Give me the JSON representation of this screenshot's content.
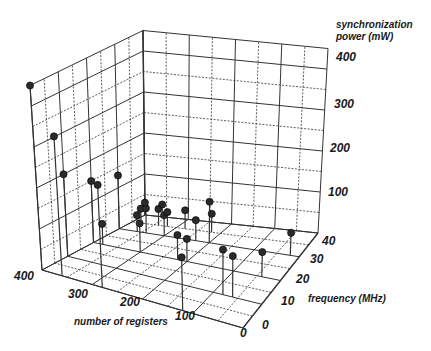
{
  "chart_data": {
    "type": "scatter",
    "subtype": "3d-stem",
    "title": "",
    "axes": {
      "x": {
        "label": "number of registers",
        "ticks": [
          400,
          300,
          200,
          100,
          0
        ],
        "range": [
          0,
          400
        ]
      },
      "y": {
        "label": "frequency (MHz)",
        "ticks": [
          0,
          10,
          20,
          30,
          40
        ],
        "range": [
          0,
          40
        ]
      },
      "z": {
        "label_line1": "synchronization",
        "label_line2": "power (mW)",
        "ticks": [
          100,
          200,
          300,
          400
        ],
        "range": [
          0,
          450
        ]
      }
    },
    "grid": true,
    "legend": "none",
    "marker_color": "#2a2a2a",
    "points": [
      {
        "registers": 0,
        "frequency_mhz": 40,
        "power_mw": 450
      },
      {
        "registers": 40,
        "frequency_mhz": 40,
        "power_mw": 340
      },
      {
        "registers": 120,
        "frequency_mhz": 40,
        "power_mw": 250
      },
      {
        "registers": 0,
        "frequency_mhz": 30,
        "power_mw": 200
      },
      {
        "registers": 0,
        "frequency_mhz": 20,
        "power_mw": 150
      },
      {
        "registers": 0,
        "frequency_mhz": 10,
        "power_mw": 130
      },
      {
        "registers": 280,
        "frequency_mhz": 40,
        "power_mw": 130
      },
      {
        "registers": 320,
        "frequency_mhz": 30,
        "power_mw": 110
      },
      {
        "registers": 340,
        "frequency_mhz": 30,
        "power_mw": 100
      },
      {
        "registers": 360,
        "frequency_mhz": 20,
        "power_mw": 60
      },
      {
        "registers": 380,
        "frequency_mhz": 10,
        "power_mw": 55
      },
      {
        "registers": 200,
        "frequency_mhz": 10,
        "power_mw": 100
      },
      {
        "registers": 180,
        "frequency_mhz": 20,
        "power_mw": 60
      },
      {
        "registers": 200,
        "frequency_mhz": 20,
        "power_mw": 55
      },
      {
        "registers": 170,
        "frequency_mhz": 10,
        "power_mw": 50
      },
      {
        "registers": 180,
        "frequency_mhz": 5,
        "power_mw": 45
      },
      {
        "registers": 100,
        "frequency_mhz": 20,
        "power_mw": 70
      },
      {
        "registers": 60,
        "frequency_mhz": 10,
        "power_mw": 60
      },
      {
        "registers": 100,
        "frequency_mhz": 10,
        "power_mw": 50
      },
      {
        "registers": 120,
        "frequency_mhz": 5,
        "power_mw": 45
      },
      {
        "registers": 20,
        "frequency_mhz": 20,
        "power_mw": 50
      },
      {
        "registers": 40,
        "frequency_mhz": 10,
        "power_mw": 40
      },
      {
        "registers": 60,
        "frequency_mhz": 5,
        "power_mw": 40
      },
      {
        "registers": 80,
        "frequency_mhz": 5,
        "power_mw": 35
      },
      {
        "registers": 20,
        "frequency_mhz": 5,
        "power_mw": 35
      },
      {
        "registers": 40,
        "frequency_mhz": 0,
        "power_mw": 30
      },
      {
        "registers": 0,
        "frequency_mhz": 0,
        "power_mw": 30
      }
    ]
  }
}
